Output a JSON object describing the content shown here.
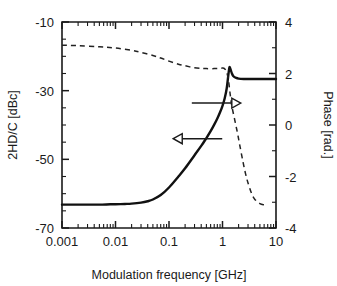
{
  "chart_data": {
    "type": "line",
    "title": "",
    "xlabel": "Modulation frequency [GHz]",
    "xscale": "log",
    "xlim": [
      0.001,
      10
    ],
    "xticks": [
      0.001,
      0.01,
      0.1,
      1,
      10
    ],
    "xticklabels": [
      "0.001",
      "0.01",
      "0.1",
      "1",
      "10"
    ],
    "grid": false,
    "legend": "none",
    "annotations": [
      {
        "name": "left-arrow",
        "points_to": "left-axis",
        "direction": "left",
        "x_data": 0.12,
        "y_data": -44.0
      },
      {
        "name": "right-arrow",
        "points_to": "right-axis",
        "direction": "right",
        "x_data": 2.2,
        "y_data": 0.85
      }
    ],
    "axes": [
      {
        "id": "left",
        "ylabel": "2HD/C [dBc]",
        "ylim": [
          -70,
          -10
        ],
        "yticks": [
          -70,
          -50,
          -30,
          -10
        ],
        "yticklabels": [
          "-70",
          "-50",
          "-30",
          "-10"
        ],
        "minor_tick_step": 5
      },
      {
        "id": "right",
        "ylabel": "Phase [rad.]",
        "ylim": [
          -4,
          4
        ],
        "yticks": [
          -4,
          -2,
          0,
          2,
          4
        ],
        "yticklabels": [
          "-4",
          "-2",
          "0",
          "2",
          "4"
        ],
        "minor_tick_step": 1
      }
    ],
    "series": [
      {
        "name": "2HD/C",
        "axis": "left",
        "style": "solid",
        "unit": "dBc",
        "x": [
          0.001,
          0.002,
          0.003,
          0.005,
          0.008,
          0.01,
          0.015,
          0.02,
          0.03,
          0.04,
          0.05,
          0.07,
          0.1,
          0.15,
          0.2,
          0.3,
          0.4,
          0.5,
          0.6,
          0.7,
          0.8,
          0.9,
          1.0,
          1.1,
          1.2,
          1.3,
          1.35,
          1.4,
          1.5,
          1.6,
          1.8,
          2.0,
          2.5,
          3.0,
          4.0,
          5.0,
          7.0,
          10.0
        ],
        "y": [
          -63.2,
          -63.2,
          -63.2,
          -63.2,
          -63.1,
          -63.1,
          -63.0,
          -62.9,
          -62.6,
          -62.2,
          -61.7,
          -60.4,
          -58.2,
          -55.0,
          -52.6,
          -48.8,
          -46.1,
          -43.8,
          -41.8,
          -39.9,
          -38.1,
          -36.3,
          -34.4,
          -32.2,
          -29.3,
          -24.8,
          -23.2,
          -23.6,
          -25.0,
          -25.8,
          -26.3,
          -26.5,
          -26.6,
          -26.6,
          -26.6,
          -26.6,
          -26.6,
          -26.6
        ]
      },
      {
        "name": "Phase",
        "axis": "right",
        "style": "dashed",
        "unit": "rad.",
        "x": [
          0.001,
          0.002,
          0.005,
          0.01,
          0.02,
          0.03,
          0.05,
          0.07,
          0.1,
          0.15,
          0.2,
          0.3,
          0.4,
          0.5,
          0.7,
          0.9,
          1.0,
          1.1,
          1.2,
          1.3,
          1.4,
          1.5,
          1.7,
          1.9,
          2.1,
          2.4,
          2.7,
          3.0,
          3.5,
          4.0,
          5.0,
          6.0
        ],
        "y": [
          3.1,
          3.08,
          3.04,
          2.99,
          2.9,
          2.82,
          2.7,
          2.6,
          2.48,
          2.36,
          2.3,
          2.22,
          2.2,
          2.19,
          2.19,
          2.2,
          2.21,
          2.18,
          2.05,
          1.7,
          1.15,
          0.72,
          0.18,
          -0.3,
          -0.78,
          -1.4,
          -1.9,
          -2.25,
          -2.66,
          -2.88,
          -3.05,
          -3.1
        ]
      }
    ]
  }
}
